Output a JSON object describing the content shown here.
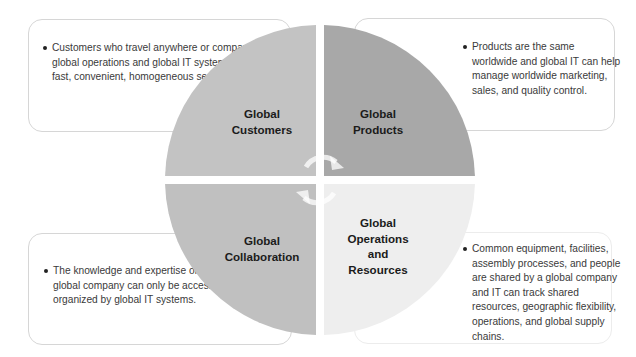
{
  "diagram": {
    "type": "four-quadrant-cycle",
    "colors": {
      "customers": "#c3c3c3",
      "products": "#a8a8a8",
      "collaboration": "#c0c0c0",
      "operations": "#eeeeee",
      "box_border": "#d6d6d6",
      "text": "#3a3a3a",
      "label": "#1b1b1b"
    },
    "quadrants": [
      {
        "position": "top-left",
        "label_line1": "Global",
        "label_line2": "Customers",
        "description": "Customers who travel anywhere or companies with global operations and global IT systems help provide fast, convenient, homogeneous service."
      },
      {
        "position": "top-right",
        "label_line1": "Global",
        "label_line2": "Products",
        "description": "Products are the same worldwide and global IT can help manage worldwide marketing, sales, and quality control."
      },
      {
        "position": "bottom-left",
        "label_line1": "Global",
        "label_line2": "Collaboration",
        "description": "The knowledge and expertise of colleagues in a global company can only be accessed, shared, and organized by global IT systems."
      },
      {
        "position": "bottom-right",
        "label_line1": "Global",
        "label_line2": "Operations",
        "label_line3": "and",
        "label_line4": "Resources",
        "description": "Common equipment, facilities, assembly processes, and people are shared by a global company and IT can track shared resources, geographic flexibility, operations, and global supply chains."
      }
    ],
    "center_icon": "circular-arrows-icon"
  }
}
